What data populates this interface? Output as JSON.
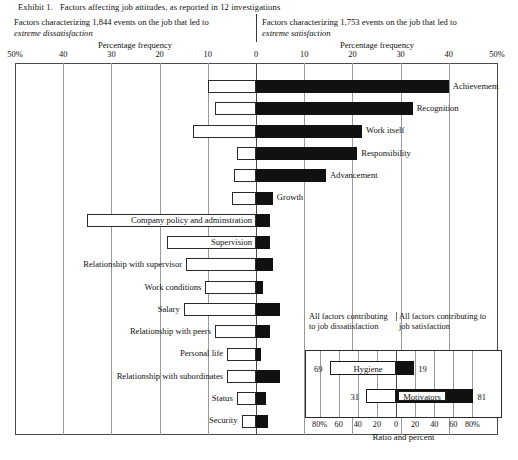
{
  "exhibit": {
    "label": "Exhibit 1.",
    "title": "Factors affecting job attitudes, as reported in 12 investigations"
  },
  "header": {
    "left": {
      "line1": "Factors characterizing 1,844 events on the job that led to",
      "line2": "extreme dissatisfaction",
      "axis_title": "Percentage frequency"
    },
    "right": {
      "line1": "Factors characterizing 1,753 events on the job that led to",
      "line2": "extreme satisfaction",
      "axis_title": "Percentage frequency"
    }
  },
  "chart_data": {
    "type": "bar",
    "orientation": "horizontal-diverging",
    "title": "Factors affecting job attitudes, as reported in 12 investigations",
    "xlabel": "Percentage frequency",
    "ylabel": "",
    "xlim": [
      -50,
      50
    ],
    "grid": true,
    "tick_labels": [
      "50%",
      "40",
      "30",
      "20",
      "10",
      "0",
      "10",
      "20",
      "30",
      "40",
      "50%"
    ],
    "tick_values": [
      -50,
      -40,
      -30,
      -20,
      -10,
      0,
      10,
      20,
      30,
      40,
      50
    ],
    "series": [
      {
        "name": "Dissatisfaction (hygiene side, white bars)",
        "fill": "white"
      },
      {
        "name": "Satisfaction (motivator side, black bars)",
        "fill": "black"
      }
    ],
    "categories": [
      "Achievement",
      "Recognition",
      "Work itself",
      "Responsibility",
      "Advancement",
      "Growth",
      "Company policy and adminstration",
      "Supervision",
      "Relationship with supervisor",
      "Work conditions",
      "Salary",
      "Relationship with peers",
      "Personal life",
      "Relationship with subordinates",
      "Status",
      "Security"
    ],
    "bars": [
      {
        "label": "Achievement",
        "neg": 10.0,
        "pos": 40.0,
        "label_side": "right"
      },
      {
        "label": "Recognition",
        "neg": 8.5,
        "pos": 32.5,
        "label_side": "right"
      },
      {
        "label": "Work itself",
        "neg": 13.0,
        "pos": 22.0,
        "label_side": "right"
      },
      {
        "label": "Responsibility",
        "neg": 4.0,
        "pos": 21.0,
        "label_side": "right"
      },
      {
        "label": "Advancement",
        "neg": 4.5,
        "pos": 14.5,
        "label_side": "right"
      },
      {
        "label": "Growth",
        "neg": 5.0,
        "pos": 3.5,
        "label_side": "right"
      },
      {
        "label": "Company policy and adminstration",
        "neg": 35.0,
        "pos": 3.0,
        "label_side": "inside-left"
      },
      {
        "label": "Supervision",
        "neg": 18.5,
        "pos": 3.0,
        "label_side": "inside-left"
      },
      {
        "label": "Relationship with supervisor",
        "neg": 14.5,
        "pos": 3.5,
        "label_side": "left"
      },
      {
        "label": "Work conditions",
        "neg": 10.5,
        "pos": 1.5,
        "label_side": "left"
      },
      {
        "label": "Salary",
        "neg": 15.0,
        "pos": 5.0,
        "label_side": "left"
      },
      {
        "label": "Relationship with peers",
        "neg": 8.5,
        "pos": 3.0,
        "label_side": "left"
      },
      {
        "label": "Personal life",
        "neg": 6.0,
        "pos": 1.0,
        "label_side": "left"
      },
      {
        "label": "Relationship with subordinates",
        "neg": 6.0,
        "pos": 5.0,
        "label_side": "left"
      },
      {
        "label": "Status",
        "neg": 4.0,
        "pos": 2.0,
        "label_side": "left"
      },
      {
        "label": "Security",
        "neg": 3.0,
        "pos": 2.5,
        "label_side": "left"
      }
    ]
  },
  "inset": {
    "caption_left": "All factors contributing to job dissatisfaction",
    "caption_right": "All factors contributing to job satisfaction",
    "axis_title": "Ratio and percent",
    "tick_labels": [
      "80%",
      "60",
      "40",
      "20",
      "0",
      "20",
      "40",
      "60",
      "80%"
    ],
    "tick_values": [
      -80,
      -60,
      -40,
      -20,
      0,
      20,
      40,
      60,
      80
    ],
    "xlim": [
      -90,
      90
    ],
    "rows": [
      {
        "name": "Hygiene",
        "neg": 69,
        "pos": 19,
        "neg_label": "69",
        "pos_label": "19",
        "name_style": "plain"
      },
      {
        "name": "Motivators",
        "neg": 31,
        "pos": 81,
        "neg_label": "31",
        "pos_label": "81",
        "name_style": "boxed"
      }
    ]
  },
  "colors": {
    "bar_fill_positive": "#111111",
    "bar_fill_negative": "#ffffff",
    "bar_stroke": "#2a2a2a",
    "grid": "#9a9a9a",
    "frame": "#4a4a4a",
    "text": "#111111",
    "background": "#ffffff"
  }
}
